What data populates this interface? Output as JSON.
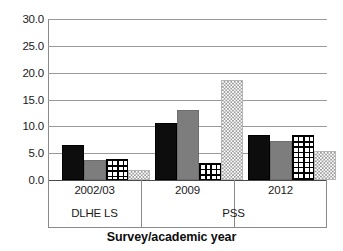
{
  "chart_data": {
    "type": "bar",
    "title": "",
    "xlabel": "Survey/academic year",
    "ylabel": "",
    "ylim": [
      0.0,
      30.0
    ],
    "ytick_labels": [
      "30.0",
      "25.0",
      "20.0",
      "15.0",
      "10.0",
      "5.0",
      "0.0"
    ],
    "ytick_values": [
      30.0,
      25.0,
      20.0,
      15.0,
      10.0,
      5.0,
      0.0
    ],
    "grid": true,
    "legend": "none",
    "categories": [
      "2002/03",
      "2009",
      "2012"
    ],
    "group_labels": [
      "DLHE LS",
      "PSS"
    ],
    "group_spans": [
      [
        "2002/03"
      ],
      [
        "2009",
        "2012"
      ]
    ],
    "series": [
      {
        "name": "series-1",
        "pattern": "solid-black",
        "values": [
          6.5,
          10.7,
          8.4
        ]
      },
      {
        "name": "series-2",
        "pattern": "solid-gray",
        "values": [
          3.7,
          13.0,
          7.3
        ]
      },
      {
        "name": "series-3",
        "pattern": "crosshatch",
        "values": [
          4.0,
          3.1,
          8.3
        ]
      },
      {
        "name": "series-4",
        "pattern": "dotted",
        "values": [
          1.8,
          18.6,
          5.4
        ]
      }
    ],
    "colors": {
      "series_1": "#0d0d0d",
      "series_2": "#7d7d7d",
      "series_3": "#000000",
      "series_4": "#9d9d9d",
      "gridline": "#9a9a9a",
      "axis": "#8a8a8a",
      "background": "#ffffff",
      "text": "#1a1a1a"
    }
  }
}
